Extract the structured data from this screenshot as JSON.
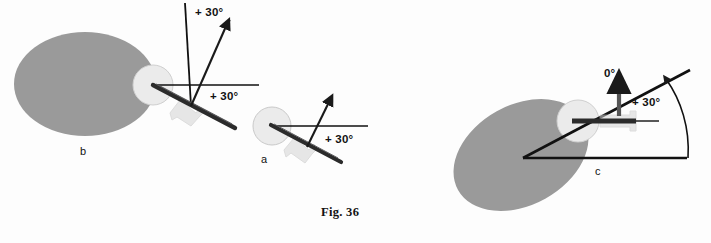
{
  "figure": {
    "caption": "Fig. 36",
    "background_color": "#fdfdfd",
    "bone_color": "#9a9a9a",
    "head_color": "#e9e9e9",
    "line_color": "#111111",
    "needle_color": "#2b2b2b",
    "hub_color": "#c9c9c9"
  },
  "panels": [
    {
      "id": "b",
      "label": "b",
      "annotations": [
        {
          "name": "vertical-axis-angle",
          "text": "+ 30°"
        },
        {
          "name": "horizontal-axis-angle",
          "text": "+ 30°"
        }
      ]
    },
    {
      "id": "a",
      "label": "a",
      "annotations": [
        {
          "name": "horizontal-axis-angle",
          "text": "+ 30°"
        }
      ]
    },
    {
      "id": "c",
      "label": "c",
      "annotations": [
        {
          "name": "zero-reference",
          "text": "0°"
        },
        {
          "name": "wedge-angle",
          "text": "+ 30°"
        }
      ]
    }
  ],
  "labels": {
    "panel_b": "b",
    "panel_a": "a",
    "panel_c": "c",
    "b_top_angle": "+ 30°",
    "b_side_angle": "+ 30°",
    "a_angle": "+ 30°",
    "c_zero": "0°",
    "c_angle": "+ 30°",
    "caption": "Fig. 36"
  }
}
